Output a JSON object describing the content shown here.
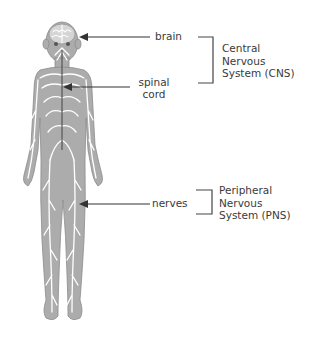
{
  "diagram": {
    "labels": {
      "brain": "brain",
      "spinal_cord_line1": "spinal",
      "spinal_cord_line2": "cord",
      "nerves": "nerves"
    },
    "groups": {
      "cns": {
        "line1": "Central",
        "line2": "Nervous",
        "line3": "System (CNS)"
      },
      "pns": {
        "line1": "Peripheral",
        "line2": "Nervous",
        "line3": "System (PNS)"
      }
    },
    "colors": {
      "body_fill": "#a9a9a9",
      "body_outline": "#8a8a8a",
      "nerve_lines": "#ffffff",
      "spinal_cord": "#555555",
      "arrows": "#333333",
      "text": "#3a3a3a"
    }
  }
}
